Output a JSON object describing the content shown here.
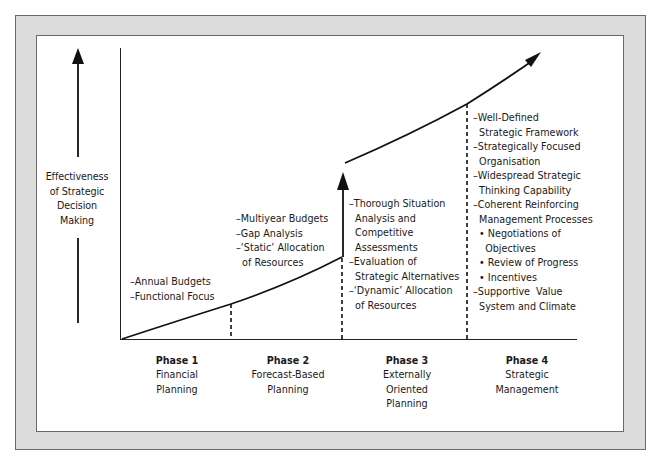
{
  "y_axis": {
    "label": "Effectiveness\nof Strategic\nDecision\nMaking"
  },
  "phases": [
    {
      "title": "Phase 1",
      "name": "Financial\nPlanning",
      "characteristics": [
        "–Annual Budgets",
        "–Functional Focus"
      ]
    },
    {
      "title": "Phase 2",
      "name": "Forecast-Based\nPlanning",
      "characteristics": [
        "–Multiyear Budgets",
        "–Gap Analysis",
        "–‘Static’ Allocation",
        "  of Resources"
      ]
    },
    {
      "title": "Phase 3",
      "name": "Externally\nOriented\nPlanning",
      "characteristics": [
        "–Thorough Situation",
        "  Analysis and",
        "  Competitive",
        "  Assessments",
        "–Evaluation of",
        "  Strategic Alternatives",
        "–‘Dynamic’ Allocation",
        "  of Resources"
      ]
    },
    {
      "title": "Phase 4",
      "name": "Strategic\nManagement",
      "characteristics": [
        "–Well-Defined",
        "  Strategic Framework",
        "–Strategically Focused",
        "  Organisation",
        "–Widespread Strategic",
        "  Thinking Capability",
        "–Coherent Reinforcing",
        "  Management Processes",
        "  • Negotiations of",
        "    Objectives",
        "  • Review of Progress",
        "  • Incentives",
        "–Supportive  Value",
        "  System and Climate"
      ]
    }
  ],
  "colors": {
    "frame": "#dcdcdc",
    "border": "#6a6a6a",
    "line": "#111111",
    "panel": "#ffffff"
  }
}
